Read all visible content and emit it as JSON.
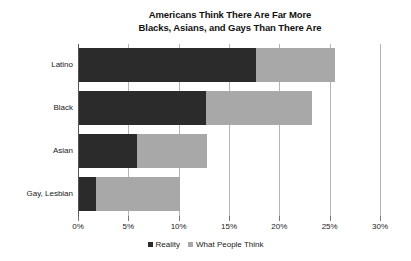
{
  "chart_data": {
    "type": "bar",
    "orientation": "horizontal",
    "title": "Americans Think There Are Far More Blacks, Asians, and Gays Than There Are",
    "title_lines": [
      "Americans Think There Are Far More",
      "Blacks, Asians, and Gays Than There Are"
    ],
    "categories": [
      "Latino",
      "Black",
      "Asian",
      "Gay, Lesbian"
    ],
    "series": [
      {
        "name": "Reality",
        "color": "#2b2b2b",
        "values": [
          17.7,
          12.7,
          5.9,
          1.8
        ]
      },
      {
        "name": "What People Think",
        "color": "#a8a8a8",
        "values": [
          25.5,
          23.2,
          12.8,
          10.1
        ]
      }
    ],
    "xlabel": "",
    "ylabel": "",
    "xlim": [
      0,
      30
    ],
    "xtick_values": [
      0,
      5,
      10,
      15,
      20,
      25,
      30
    ],
    "xtick_labels": [
      "0%",
      "5%",
      "10%",
      "15%",
      "20%",
      "25%",
      "30%"
    ],
    "grid": true,
    "grid_axis": "x",
    "legend_position": "bottom",
    "legend_entries": [
      "Reality",
      "What People Think"
    ],
    "overlap_style": "overlaid-reality-on-top"
  },
  "legend": {
    "items": [
      {
        "label": "Reality",
        "color": "#2b2b2b"
      },
      {
        "label": "What People Think",
        "color": "#a8a8a8"
      }
    ]
  },
  "colors": {
    "reality": "#2b2b2b",
    "what_people_think": "#a8a8a8",
    "gridline": "#b5b5b5",
    "axis": "#555555",
    "background": "#ffffff",
    "text": "#1a1a1a"
  }
}
